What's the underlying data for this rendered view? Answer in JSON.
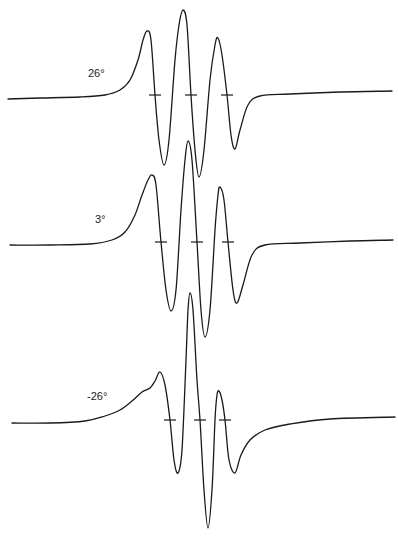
{
  "chart_data": {
    "type": "line",
    "title": "",
    "xlabel": "",
    "ylabel": "",
    "grid": false,
    "legend": "none",
    "series": [
      {
        "name": "26°",
        "label": "26°",
        "label_pos": [
          88,
          77
        ],
        "ticks_x": [
          155,
          191,
          227
        ],
        "tick_y": 95,
        "points": [
          [
            8,
            99
          ],
          [
            40,
            98
          ],
          [
            80,
            97
          ],
          [
            105,
            95
          ],
          [
            120,
            90
          ],
          [
            130,
            80
          ],
          [
            138,
            60
          ],
          [
            143,
            40
          ],
          [
            147,
            31
          ],
          [
            151,
            40
          ],
          [
            155,
            95
          ],
          [
            159,
            140
          ],
          [
            164,
            165
          ],
          [
            169,
            140
          ],
          [
            175,
            60
          ],
          [
            179,
            25
          ],
          [
            183,
            10
          ],
          [
            187,
            25
          ],
          [
            191,
            95
          ],
          [
            195,
            150
          ],
          [
            199,
            177
          ],
          [
            204,
            150
          ],
          [
            210,
            80
          ],
          [
            215,
            45
          ],
          [
            218,
            38
          ],
          [
            222,
            55
          ],
          [
            227,
            95
          ],
          [
            231,
            135
          ],
          [
            235,
            149
          ],
          [
            240,
            130
          ],
          [
            248,
            105
          ],
          [
            260,
            96
          ],
          [
            290,
            94
          ],
          [
            340,
            92
          ],
          [
            392,
            91
          ]
        ]
      },
      {
        "name": "3°",
        "label": "3°",
        "label_pos": [
          95,
          223
        ],
        "ticks_x": [
          161,
          197,
          228
        ],
        "tick_y": 242,
        "points": [
          [
            10,
            245
          ],
          [
            50,
            245
          ],
          [
            90,
            244
          ],
          [
            112,
            240
          ],
          [
            125,
            232
          ],
          [
            135,
            215
          ],
          [
            142,
            195
          ],
          [
            148,
            180
          ],
          [
            152,
            175
          ],
          [
            156,
            185
          ],
          [
            161,
            242
          ],
          [
            166,
            290
          ],
          [
            171,
            311
          ],
          [
            176,
            290
          ],
          [
            181,
            210
          ],
          [
            185,
            160
          ],
          [
            188,
            141
          ],
          [
            192,
            160
          ],
          [
            197,
            242
          ],
          [
            201,
            310
          ],
          [
            205,
            337
          ],
          [
            210,
            310
          ],
          [
            215,
            230
          ],
          [
            218,
            195
          ],
          [
            220,
            187
          ],
          [
            224,
            200
          ],
          [
            228,
            242
          ],
          [
            233,
            290
          ],
          [
            237,
            303
          ],
          [
            243,
            285
          ],
          [
            252,
            255
          ],
          [
            265,
            245
          ],
          [
            300,
            243
          ],
          [
            350,
            241
          ],
          [
            393,
            240
          ]
        ]
      },
      {
        "name": "-26°",
        "label": "-26°",
        "label_pos": [
          87,
          400
        ],
        "ticks_x": [
          170,
          200,
          225
        ],
        "tick_y": 420,
        "points": [
          [
            12,
            423
          ],
          [
            50,
            423
          ],
          [
            85,
            421
          ],
          [
            105,
            416
          ],
          [
            120,
            410
          ],
          [
            132,
            401
          ],
          [
            142,
            392
          ],
          [
            150,
            388
          ],
          [
            155,
            381
          ],
          [
            160,
            372
          ],
          [
            165,
            385
          ],
          [
            170,
            420
          ],
          [
            174,
            460
          ],
          [
            178,
            473
          ],
          [
            182,
            450
          ],
          [
            186,
            360
          ],
          [
            188,
            310
          ],
          [
            190,
            293
          ],
          [
            193,
            310
          ],
          [
            197,
            380
          ],
          [
            200,
            420
          ],
          [
            204,
            490
          ],
          [
            208,
            528
          ],
          [
            212,
            490
          ],
          [
            215,
            420
          ],
          [
            217,
            395
          ],
          [
            219,
            391
          ],
          [
            222,
            400
          ],
          [
            225,
            420
          ],
          [
            229,
            460
          ],
          [
            235,
            473
          ],
          [
            241,
            455
          ],
          [
            250,
            440
          ],
          [
            265,
            430
          ],
          [
            290,
            424
          ],
          [
            330,
            419
          ],
          [
            395,
            417
          ]
        ]
      }
    ]
  }
}
